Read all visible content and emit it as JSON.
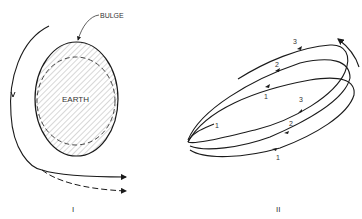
{
  "panels": [
    {
      "id": "I",
      "caption": "I",
      "labels": {
        "bulge": "BULGE",
        "earth": "EARTH"
      }
    },
    {
      "id": "II",
      "caption": "II",
      "orbit_labels": {
        "upper": [
          "3",
          "2",
          "1"
        ],
        "lower": [
          "3",
          "2",
          "1"
        ],
        "start": "1"
      }
    }
  ],
  "colors": {
    "line": "#1a1a1a",
    "hatch": "#555555",
    "text": "#333333",
    "background": "#ffffff"
  }
}
